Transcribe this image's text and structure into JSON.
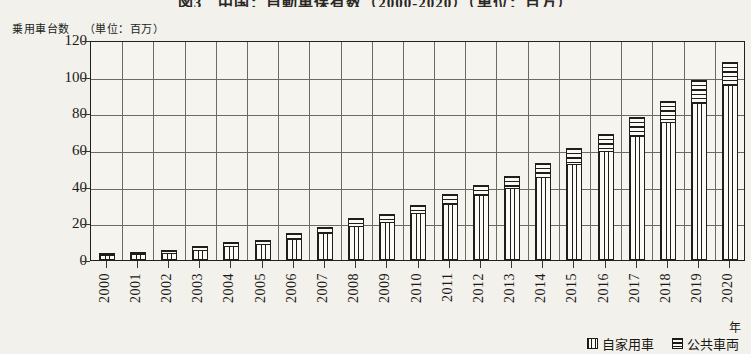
{
  "figure": {
    "title": "図3　中国：自動車保有数（2000-2020）（単位：百万）",
    "y_axis_caption": "乗用車台数",
    "y_axis_unit": "（単位：百万）",
    "x_axis_unit": "年"
  },
  "legend": {
    "position": "bottom-right",
    "entries": [
      {
        "label": "自家用車",
        "icon": "vertical-stripe-swatch"
      },
      {
        "label": "公共車両",
        "icon": "horizontal-stripe-swatch"
      }
    ]
  },
  "chart_data": {
    "type": "bar",
    "stacked": true,
    "title": "乗用車台数（単位：百万）",
    "xlabel": "年",
    "ylabel": "乗用車台数",
    "ylim": [
      0,
      120
    ],
    "ytick_values": [
      0,
      20,
      40,
      60,
      80,
      100,
      120
    ],
    "ytick_labels": [
      "0",
      "20",
      "40",
      "60",
      "80",
      "100",
      "120"
    ],
    "grid": true,
    "legend_position": "bottom-right",
    "categories": [
      "2000",
      "2001",
      "2002",
      "2003",
      "2004",
      "2005",
      "2006",
      "2007",
      "2008",
      "2009",
      "2010",
      "2011",
      "2012",
      "2013",
      "2014",
      "2015",
      "2016",
      "2017",
      "2018",
      "2019",
      "2020"
    ],
    "series": [
      {
        "name": "自家用車",
        "pattern": "vertical-stripes",
        "values": [
          2,
          2.5,
          3.5,
          5,
          7,
          8,
          11,
          14,
          18,
          20,
          25,
          30,
          35,
          39,
          45,
          52,
          59,
          67,
          75,
          85,
          95
        ]
      },
      {
        "name": "公共車両",
        "pattern": "horizontal-stripes",
        "values": [
          2,
          2,
          2,
          2.5,
          3,
          3,
          3.5,
          4,
          5,
          5,
          5,
          6,
          6,
          7,
          8,
          9,
          10,
          11,
          12,
          13,
          13
        ]
      }
    ],
    "totals": [
      4,
      4.5,
      5.5,
      7.5,
      10,
      11,
      14.5,
      18,
      23,
      25,
      30,
      36,
      41,
      46,
      53,
      61,
      69,
      78,
      87,
      98,
      108
    ]
  }
}
